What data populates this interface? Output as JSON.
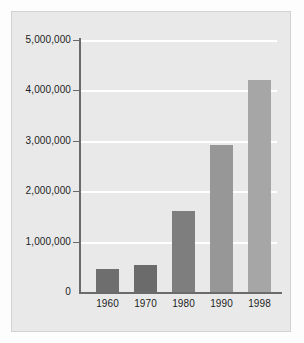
{
  "chart_data": {
    "type": "bar",
    "title": "",
    "subtitle": "",
    "xlabel": "",
    "ylabel": "",
    "categories": [
      "1960",
      "1970",
      "1980",
      "1990",
      "1998"
    ],
    "values": [
      460000,
      540000,
      1610000,
      2920000,
      4210000
    ],
    "series": [
      {
        "name": "",
        "values": [
          460000,
          540000,
          1610000,
          2920000,
          4210000
        ]
      }
    ],
    "ylim": [
      0,
      5000000
    ],
    "ytick_values": [
      0,
      1000000,
      2000000,
      3000000,
      4000000,
      5000000
    ],
    "ytick_labels": [
      "0",
      "1,000,000",
      "2,000,000",
      "3,000,000",
      "4,000,000",
      "5,000,000"
    ],
    "xtick_labels": [
      "1960",
      "1970",
      "1980",
      "1990",
      "1998"
    ],
    "grid": true,
    "grid_axis": "y",
    "legend": false,
    "legend_position": "none",
    "annotations": [],
    "bar_colors": [
      "#6e6e6e",
      "#6b6b6b",
      "#7e7e7e",
      "#979797",
      "#a6a6a6"
    ],
    "colors": {
      "panel_background": "#e9e9e9",
      "figure_background": "#fdfdfd",
      "gridline": "#ffffff",
      "axis_line": "#6b6b6b",
      "tick_label": "#1d1d1d"
    }
  }
}
